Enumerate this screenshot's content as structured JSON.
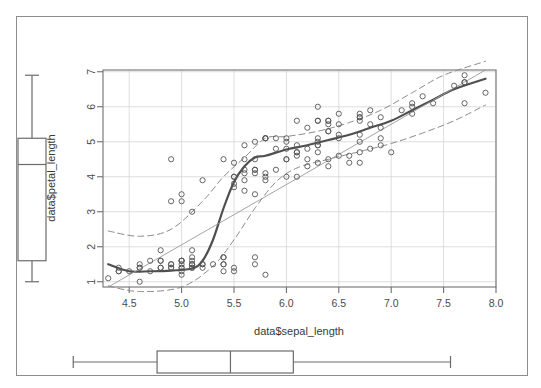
{
  "figure": {
    "kind": "scatterplot-with-marginal-boxplots",
    "background_color": "#ffffff",
    "frame_color": "#8d8d8d"
  },
  "chart_data": {
    "type": "scatter",
    "title": "",
    "xlabel": "data$sepal_length",
    "ylabel": "data$petal_length",
    "xlim": [
      4.25,
      8.0
    ],
    "ylim": [
      0.85,
      7.05
    ],
    "xticks": [
      4.5,
      5.0,
      5.5,
      6.0,
      6.5,
      7.0,
      7.5,
      8.0
    ],
    "xtick_labels": [
      "4.5",
      "5.0",
      "5.5",
      "6.0",
      "6.5",
      "7.0",
      "7.5",
      "8.0"
    ],
    "yticks": [
      1,
      2,
      3,
      4,
      5,
      6,
      7
    ],
    "ytick_labels": [
      "1",
      "2",
      "3",
      "4",
      "5",
      "6",
      "7"
    ],
    "grid": true,
    "grid_color": "#d0d0d0",
    "point_marker": "open-circle",
    "point_color": "#555555",
    "legend": "none",
    "series": [
      {
        "name": "observations",
        "marker": "open-circle",
        "x": [
          5.1,
          4.9,
          4.7,
          4.6,
          5.0,
          5.4,
          4.6,
          5.0,
          4.4,
          4.9,
          5.4,
          4.8,
          4.8,
          4.3,
          5.8,
          5.7,
          5.4,
          5.1,
          5.7,
          5.1,
          5.4,
          5.1,
          4.6,
          5.1,
          4.8,
          5.0,
          5.0,
          5.2,
          5.2,
          4.7,
          4.8,
          5.4,
          5.2,
          5.5,
          4.9,
          5.0,
          5.5,
          4.9,
          4.4,
          5.1,
          5.0,
          4.5,
          4.4,
          5.0,
          5.1,
          4.8,
          5.1,
          4.6,
          5.3,
          5.0,
          7.0,
          6.4,
          6.9,
          5.5,
          6.5,
          5.7,
          6.3,
          4.9,
          6.6,
          5.2,
          5.0,
          5.9,
          6.0,
          6.1,
          5.6,
          6.7,
          5.6,
          5.8,
          6.2,
          5.6,
          5.9,
          6.1,
          6.3,
          6.1,
          6.4,
          6.6,
          6.8,
          6.7,
          6.0,
          5.7,
          5.5,
          5.5,
          5.8,
          6.0,
          5.4,
          6.0,
          6.7,
          6.3,
          5.6,
          5.5,
          5.5,
          6.1,
          5.8,
          5.0,
          5.6,
          5.7,
          5.7,
          6.2,
          5.1,
          5.7,
          6.3,
          5.8,
          7.1,
          6.3,
          6.5,
          7.6,
          4.9,
          7.3,
          6.7,
          7.2,
          6.5,
          6.4,
          6.8,
          5.7,
          5.8,
          6.4,
          6.5,
          7.7,
          7.7,
          6.0,
          6.9,
          5.6,
          7.7,
          6.3,
          6.7,
          7.2,
          6.2,
          6.1,
          6.4,
          7.2,
          7.4,
          7.9,
          6.4,
          6.3,
          6.1,
          7.7,
          6.3,
          6.4,
          6.0,
          6.9,
          6.7,
          6.9,
          5.8,
          6.8,
          6.7,
          6.7,
          6.3,
          6.5,
          6.2,
          5.9
        ],
        "y": [
          1.4,
          1.4,
          1.3,
          1.5,
          1.4,
          1.7,
          1.4,
          1.5,
          1.4,
          1.5,
          1.5,
          1.6,
          1.4,
          1.1,
          1.2,
          1.5,
          1.3,
          1.4,
          1.7,
          1.5,
          1.7,
          1.5,
          1.0,
          1.7,
          1.9,
          1.6,
          1.6,
          1.5,
          1.4,
          1.6,
          1.6,
          1.5,
          1.5,
          1.4,
          1.5,
          1.2,
          1.3,
          1.4,
          1.3,
          1.5,
          1.3,
          1.3,
          1.3,
          1.6,
          1.9,
          1.4,
          1.6,
          1.4,
          1.5,
          1.4,
          4.7,
          4.5,
          4.9,
          4.0,
          4.6,
          4.5,
          4.7,
          3.3,
          4.6,
          3.9,
          3.5,
          4.2,
          4.0,
          4.7,
          3.6,
          4.4,
          4.5,
          4.1,
          4.5,
          3.9,
          4.8,
          4.0,
          4.9,
          4.7,
          4.3,
          4.4,
          4.8,
          5.0,
          4.5,
          3.5,
          3.8,
          3.7,
          3.9,
          5.1,
          4.5,
          4.5,
          4.7,
          4.4,
          4.1,
          4.0,
          4.4,
          4.6,
          4.0,
          3.3,
          4.2,
          4.2,
          4.2,
          4.3,
          3.0,
          4.1,
          6.0,
          5.1,
          5.9,
          5.6,
          5.8,
          6.6,
          4.5,
          6.3,
          5.8,
          6.1,
          5.1,
          5.3,
          5.5,
          5.0,
          5.1,
          5.3,
          5.5,
          6.7,
          6.9,
          5.0,
          5.7,
          4.9,
          6.7,
          4.9,
          5.7,
          6.0,
          4.8,
          4.9,
          5.6,
          5.8,
          6.1,
          6.4,
          5.6,
          5.1,
          5.6,
          6.1,
          5.6,
          5.5,
          4.8,
          5.4,
          5.6,
          5.1,
          5.1,
          5.9,
          5.7,
          5.2,
          5.0,
          5.2,
          5.4,
          5.1
        ]
      }
    ],
    "overlays": [
      {
        "name": "lowess-smoother",
        "style": "solid",
        "width": 2.2,
        "color": "#4f4f4f",
        "x": [
          4.3,
          4.5,
          4.7,
          4.9,
          5.1,
          5.2,
          5.3,
          5.4,
          5.5,
          5.6,
          5.7,
          5.8,
          6.0,
          6.2,
          6.4,
          6.6,
          6.8,
          7.0,
          7.2,
          7.4,
          7.6,
          7.9
        ],
        "y": [
          1.5,
          1.3,
          1.3,
          1.32,
          1.38,
          1.6,
          2.2,
          3.1,
          3.85,
          4.3,
          4.55,
          4.6,
          4.78,
          4.9,
          5.05,
          5.2,
          5.4,
          5.6,
          5.9,
          6.2,
          6.5,
          6.8
        ]
      },
      {
        "name": "linear-fit",
        "style": "solid-thin",
        "width": 0.9,
        "color": "#9a9a9a",
        "x": [
          4.3,
          7.9
        ],
        "y": [
          0.85,
          7.05
        ]
      },
      {
        "name": "upper-band",
        "style": "dashed",
        "width": 1.0,
        "color": "#8a8a8a",
        "x": [
          4.3,
          4.6,
          4.9,
          5.2,
          5.4,
          5.6,
          5.8,
          6.0,
          6.3,
          6.6,
          6.9,
          7.2,
          7.5,
          7.9
        ],
        "y": [
          2.45,
          2.3,
          2.5,
          3.3,
          4.0,
          4.55,
          5.1,
          5.15,
          5.3,
          5.55,
          5.9,
          6.4,
          6.9,
          7.3
        ]
      },
      {
        "name": "lower-band",
        "style": "dashed",
        "width": 1.0,
        "color": "#8a8a8a",
        "x": [
          4.3,
          4.6,
          5.0,
          5.3,
          5.5,
          5.7,
          5.9,
          6.1,
          6.4,
          6.7,
          7.0,
          7.3,
          7.6,
          7.9
        ],
        "y": [
          0.88,
          0.72,
          0.85,
          1.45,
          2.2,
          3.1,
          3.85,
          4.25,
          4.5,
          4.72,
          4.95,
          5.25,
          5.6,
          6.05
        ]
      }
    ]
  },
  "marginal_boxplots": {
    "y_boxplot": {
      "name": "petal-length-boxplot",
      "orientation": "vertical",
      "min": 1.0,
      "q1": 1.6,
      "median": 4.35,
      "q3": 5.1,
      "max": 6.9,
      "stroke": "#6b6b6b"
    },
    "x_boxplot": {
      "name": "sepal-length-boxplot",
      "orientation": "horizontal",
      "min": 4.3,
      "q1": 5.1,
      "median": 5.8,
      "q3": 6.4,
      "max": 7.9,
      "stroke": "#6b6b6b"
    }
  }
}
